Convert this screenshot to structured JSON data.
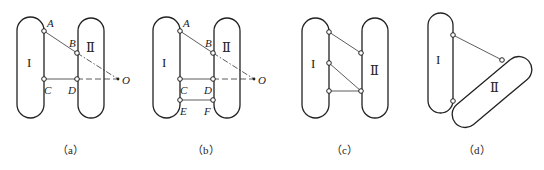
{
  "figure": {
    "panels": [
      {
        "id": "a",
        "caption": "（a）",
        "body_I_label": "I",
        "body_II_label": "Ⅱ",
        "points": {
          "A": "A",
          "B": "B",
          "C": "C",
          "D": "D",
          "O": "O"
        },
        "links": [
          "A-B",
          "C-D"
        ],
        "extensions": [
          "B-O (dash-dot)",
          "D-O (dashed)"
        ]
      },
      {
        "id": "b",
        "caption": "（b）",
        "body_I_label": "I",
        "body_II_label": "Ⅱ",
        "points": {
          "A": "A",
          "B": "B",
          "C": "C",
          "D": "D",
          "E": "E",
          "F": "F",
          "O": "O"
        },
        "links": [
          "A-B",
          "C-D",
          "E-F"
        ],
        "extensions": [
          "B-O (dash-dot)",
          "D-O (dashed)"
        ]
      },
      {
        "id": "c",
        "caption": "（c）",
        "body_I_label": "I",
        "body_II_label": "Ⅱ",
        "links": [
          "I1-II1",
          "I2-II2",
          "I3-II2"
        ]
      },
      {
        "id": "d",
        "caption": "（d）",
        "body_I_label": "I",
        "body_II_label": "Ⅱ",
        "links": [
          "I1-II1",
          "I2-II2 (direct contact hinge)"
        ]
      }
    ]
  }
}
